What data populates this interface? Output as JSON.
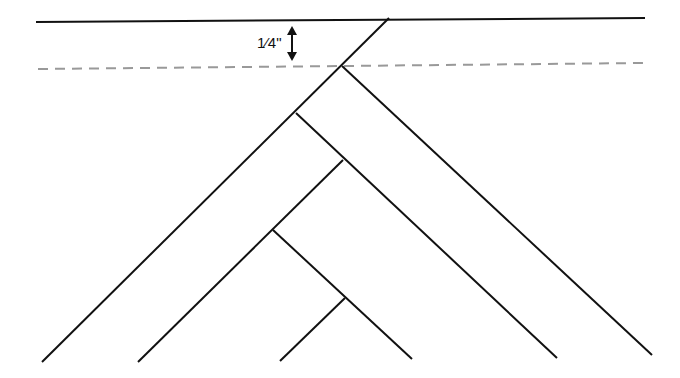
{
  "diagram": {
    "measurement_label": "1⁄4\"",
    "colors": {
      "line": "#111111",
      "dashed": "#999999",
      "background": "#ffffff"
    },
    "top_line": {
      "x1": 36,
      "y1": 22,
      "x2": 645,
      "y2": 18
    },
    "seam_line": {
      "x1": 38,
      "y1": 69,
      "x2": 645,
      "y2": 63
    },
    "arrow": {
      "x": 292,
      "y1": 26,
      "y2": 61
    },
    "strips": [
      {
        "x1": 389,
        "y1": 18,
        "x2": 42,
        "y2": 362
      },
      {
        "x1": 342,
        "y1": 66,
        "x2": 652,
        "y2": 355
      },
      {
        "x1": 296,
        "y1": 113,
        "x2": 557,
        "y2": 358
      },
      {
        "x1": 343,
        "y1": 160,
        "x2": 138,
        "y2": 362
      },
      {
        "x1": 273,
        "y1": 230,
        "x2": 412,
        "y2": 359
      },
      {
        "x1": 345,
        "y1": 298,
        "x2": 280,
        "y2": 361
      }
    ]
  }
}
